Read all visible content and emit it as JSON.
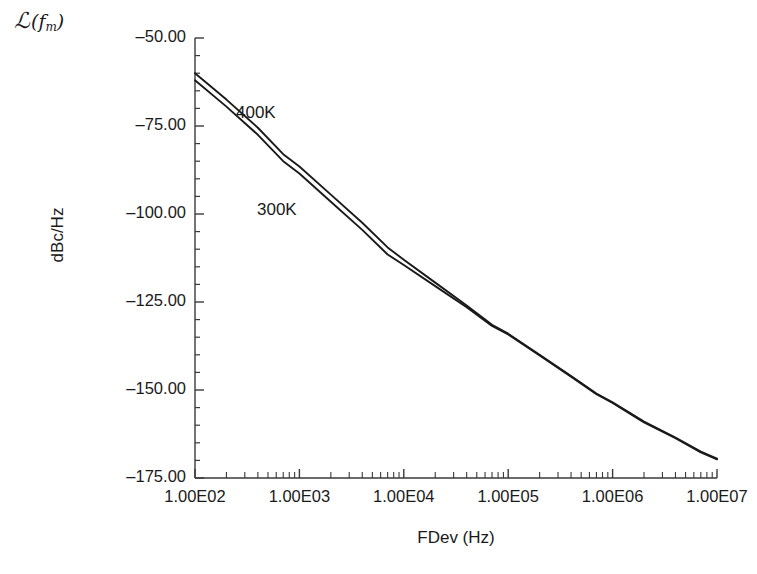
{
  "chart_data": {
    "type": "line",
    "title": "",
    "xlabel": "FDev (Hz)",
    "ylabel": "dBc/Hz",
    "y_axis_symbol": "L(f_m)",
    "xscale": "log",
    "yscale": "linear",
    "xlim": [
      100,
      10000000
    ],
    "ylim": [
      -175,
      -50
    ],
    "grid": false,
    "legend_position": "inline-annotation",
    "xticks": [
      "1.00E02",
      "1.00E03",
      "1.00E04",
      "1.00E05",
      "1.00E06",
      "1.00E07"
    ],
    "xtick_values": [
      100,
      1000,
      10000,
      100000,
      1000000,
      10000000
    ],
    "yticks": [
      "-50.00",
      "-75.00",
      "-100.00",
      "-125.00",
      "-150.00",
      "-175.00"
    ],
    "ytick_values": [
      -50,
      -75,
      -100,
      -125,
      -150,
      -175
    ],
    "minor_ticks": "log-decade",
    "line_color": "#1a1a1a",
    "series": [
      {
        "name": "400K",
        "label": "400K",
        "x": [
          100,
          200,
          400,
          700,
          1000,
          2000,
          4000,
          7000,
          10000,
          20000,
          40000,
          70000,
          100000,
          200000,
          400000,
          700000,
          1000000,
          2000000,
          4000000,
          7000000,
          10000000
        ],
        "values": [
          -60.0,
          -67.5,
          -75.5,
          -83.0,
          -86.5,
          -94.5,
          -102.5,
          -109.5,
          -113.0,
          -119.5,
          -126.0,
          -131.5,
          -134.0,
          -140.0,
          -146.0,
          -151.0,
          -153.5,
          -159.0,
          -163.5,
          -167.5,
          -169.5
        ]
      },
      {
        "name": "300K",
        "label": "300K",
        "x": [
          100,
          200,
          400,
          700,
          1000,
          2000,
          4000,
          7000,
          10000,
          20000,
          40000,
          70000,
          100000,
          200000,
          400000,
          700000,
          1000000,
          2000000,
          4000000,
          7000000,
          10000000
        ],
        "values": [
          -62.0,
          -69.5,
          -77.5,
          -85.0,
          -88.5,
          -96.5,
          -104.5,
          -111.5,
          -114.5,
          -120.5,
          -126.5,
          -131.8,
          -134.2,
          -140.2,
          -146.2,
          -151.2,
          -153.7,
          -159.2,
          -163.7,
          -167.7,
          -169.7
        ]
      }
    ],
    "annotations": [
      {
        "text": "400K",
        "x_px": 236,
        "y_px": 103
      },
      {
        "text": "300K",
        "x_px": 257,
        "y_px": 200
      }
    ]
  },
  "axes": {
    "y_symbol_main": "ℒ",
    "y_symbol_paren_open": "(",
    "y_symbol_var": "f",
    "y_symbol_sub": "m",
    "y_symbol_paren_close": ")"
  }
}
